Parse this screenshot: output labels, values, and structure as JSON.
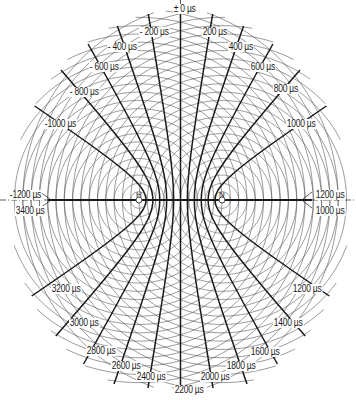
{
  "diagram": {
    "title": "",
    "canvas": {
      "width": 356,
      "height": 400
    },
    "stations": [
      {
        "id": "master",
        "label": "H",
        "x": 139,
        "y": 200
      },
      {
        "id": "slave",
        "label": "N",
        "x": 222,
        "y": 200
      }
    ],
    "baseline_y": 200,
    "unit": "µs",
    "circle_count": 24,
    "circle_spacing": 8.3,
    "colors": {
      "line": "#1a1a1a",
      "circle": "#555555",
      "background": "#ffffff"
    },
    "hyperbolas": [
      {
        "top": "-1200",
        "bottom": "3400",
        "top_label": "-1200 µs",
        "bottom_label": "3400 µs"
      },
      {
        "top": "-1000",
        "bottom": "3200",
        "top_label": "-1000 µs",
        "bottom_label": "3200 µs"
      },
      {
        "top": "-800",
        "bottom": "3000",
        "top_label": "- 800 µs",
        "bottom_label": "3000 µs"
      },
      {
        "top": "-600",
        "bottom": "2800",
        "top_label": "- 600 µs",
        "bottom_label": "2800 µs"
      },
      {
        "top": "-400",
        "bottom": "2600",
        "top_label": "- 400 µs",
        "bottom_label": "2600 µs"
      },
      {
        "top": "-200",
        "bottom": "2400",
        "top_label": "- 200 µs",
        "bottom_label": "2400 µs"
      },
      {
        "top": "0",
        "bottom": "2200",
        "top_label": "± 0 µs",
        "bottom_label": "2200 µs"
      },
      {
        "top": "200",
        "bottom": "2000",
        "top_label": "200 µs",
        "bottom_label": "2000 µs"
      },
      {
        "top": "400",
        "bottom": "1800",
        "top_label": "400 µs",
        "bottom_label": "1800 µs"
      },
      {
        "top": "600",
        "bottom": "1600",
        "top_label": "600 µs",
        "bottom_label": "1600 µs"
      },
      {
        "top": "800",
        "bottom": "1400",
        "top_label": "800 µs",
        "bottom_label": "1400 µs"
      },
      {
        "top": "1000",
        "bottom": "1200",
        "top_label": "1000 µs",
        "bottom_label": "1200 µs"
      },
      {
        "top": "1200",
        "bottom": "1000",
        "top_label": "1200 µs",
        "bottom_label": "1000 µs"
      }
    ],
    "labels": [
      {
        "text": "± 0 µs",
        "x": 173,
        "y": 4
      },
      {
        "text": "- 200 µs",
        "x": 139,
        "y": 27
      },
      {
        "text": "200 µs",
        "x": 202,
        "y": 27
      },
      {
        "text": "- 400 µs",
        "x": 107,
        "y": 42
      },
      {
        "text": "400 µs",
        "x": 228,
        "y": 42
      },
      {
        "text": "- 600 µs",
        "x": 89,
        "y": 62
      },
      {
        "text": "600 µs",
        "x": 250,
        "y": 62
      },
      {
        "text": "- 800 µs",
        "x": 69,
        "y": 87
      },
      {
        "text": "800 µs",
        "x": 273,
        "y": 84
      },
      {
        "text": "-1000 µs",
        "x": 44,
        "y": 119
      },
      {
        "text": "1000 µs",
        "x": 286,
        "y": 119
      },
      {
        "text": "-1200 µs",
        "x": 9,
        "y": 190
      },
      {
        "text": "3400 µs",
        "x": 15,
        "y": 206
      },
      {
        "text": "1200 µs",
        "x": 315,
        "y": 190
      },
      {
        "text": "1000 µs",
        "x": 315,
        "y": 206
      },
      {
        "text": "3200 µs",
        "x": 51,
        "y": 284
      },
      {
        "text": "1200 µs",
        "x": 292,
        "y": 284
      },
      {
        "text": "3000 µs",
        "x": 69,
        "y": 318
      },
      {
        "text": "1400 µs",
        "x": 273,
        "y": 318
      },
      {
        "text": "2800 µs",
        "x": 86,
        "y": 346
      },
      {
        "text": "1600 µs",
        "x": 250,
        "y": 347
      },
      {
        "text": "2600 µs",
        "x": 111,
        "y": 361
      },
      {
        "text": "1800 µs",
        "x": 226,
        "y": 361
      },
      {
        "text": "2400 µs",
        "x": 136,
        "y": 372
      },
      {
        "text": "2000 µs",
        "x": 200,
        "y": 372
      },
      {
        "text": "2200 µs",
        "x": 174,
        "y": 385
      }
    ]
  }
}
